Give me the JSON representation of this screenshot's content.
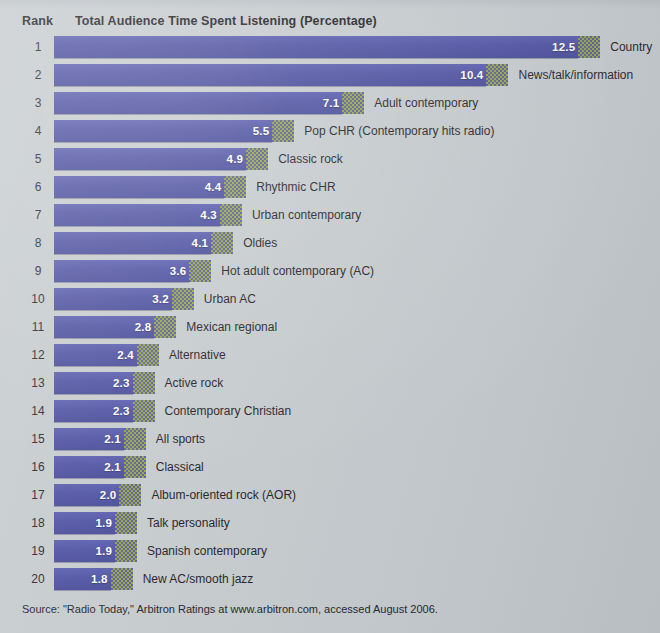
{
  "header": {
    "rank_label": "Rank",
    "title": "Total Audience Time Spent Listening (Percentage)"
  },
  "source": "Source: \"Radio Today,\" Arbitron Ratings at www.arbitron.com, accessed August 2006.",
  "colors": {
    "background": "#c5cacd",
    "bar": "#4f52a3",
    "bar_tail_accent": "#8f9f46",
    "value_text": "#ffffff",
    "label_text": "#1f2126"
  },
  "chart_data": {
    "type": "bar",
    "title": "Total Audience Time Spent Listening (Percentage)",
    "xlabel": "Percentage",
    "ylabel": "Rank",
    "orientation": "horizontal",
    "grid": false,
    "legend": "none",
    "xlim": [
      0,
      13
    ],
    "categories": [
      "Country",
      "News/talk/information",
      "Adult contemporary",
      "Pop CHR (Contemporary hits radio)",
      "Classic rock",
      "Rhythmic CHR",
      "Urban contemporary",
      "Oldies",
      "Hot adult contemporary (AC)",
      "Urban AC",
      "Mexican regional",
      "Alternative",
      "Active rock",
      "Contemporary Christian",
      "All sports",
      "Classical",
      "Album-oriented rock (AOR)",
      "Talk personality",
      "Spanish contemporary",
      "New AC/smooth jazz"
    ],
    "values": [
      12.5,
      10.4,
      7.1,
      5.5,
      4.9,
      4.4,
      4.3,
      4.1,
      3.6,
      3.2,
      2.8,
      2.4,
      2.3,
      2.3,
      2.1,
      2.1,
      2.0,
      1.9,
      1.9,
      1.8
    ],
    "ranks": [
      1,
      2,
      3,
      4,
      5,
      6,
      7,
      8,
      9,
      10,
      11,
      12,
      13,
      14,
      15,
      16,
      17,
      18,
      19,
      20
    ]
  },
  "rows": [
    {
      "rank": "1",
      "value": "12.5",
      "label": "Country"
    },
    {
      "rank": "2",
      "value": "10.4",
      "label": "News/talk/information"
    },
    {
      "rank": "3",
      "value": "7.1",
      "label": "Adult contemporary"
    },
    {
      "rank": "4",
      "value": "5.5",
      "label": "Pop CHR (Contemporary hits radio)"
    },
    {
      "rank": "5",
      "value": "4.9",
      "label": "Classic rock"
    },
    {
      "rank": "6",
      "value": "4.4",
      "label": "Rhythmic CHR"
    },
    {
      "rank": "7",
      "value": "4.3",
      "label": "Urban contemporary"
    },
    {
      "rank": "8",
      "value": "4.1",
      "label": "Oldies"
    },
    {
      "rank": "9",
      "value": "3.6",
      "label": "Hot adult contemporary (AC)"
    },
    {
      "rank": "10",
      "value": "3.2",
      "label": "Urban AC"
    },
    {
      "rank": "11",
      "value": "2.8",
      "label": "Mexican regional"
    },
    {
      "rank": "12",
      "value": "2.4",
      "label": "Alternative"
    },
    {
      "rank": "13",
      "value": "2.3",
      "label": "Active rock"
    },
    {
      "rank": "14",
      "value": "2.3",
      "label": "Contemporary Christian"
    },
    {
      "rank": "15",
      "value": "2.1",
      "label": "All sports"
    },
    {
      "rank": "16",
      "value": "2.1",
      "label": "Classical"
    },
    {
      "rank": "17",
      "value": "2.0",
      "label": "Album-oriented rock (AOR)"
    },
    {
      "rank": "18",
      "value": "1.9",
      "label": "Talk personality"
    },
    {
      "rank": "19",
      "value": "1.9",
      "label": "Spanish contemporary"
    },
    {
      "rank": "20",
      "value": "1.8",
      "label": "New AC/smooth jazz"
    }
  ]
}
